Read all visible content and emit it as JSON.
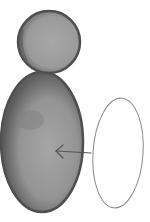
{
  "illustration": {
    "description": "Watercolor drawing of a snowman-like figure made of a gray filled circle (head) atop a tall gray filled ellipse (body), with an empty outlined ellipse to the right and an arrow pointing from the outline into the body",
    "colors": {
      "fill_light": "#a9a9a9",
      "fill_mid": "#8f8f8f",
      "fill_dark": "#5a5a5a",
      "outline": "#8a8a8a",
      "arrow": "#555555",
      "background": "#ffffff"
    },
    "shapes": {
      "head": {
        "type": "filled-circle",
        "cx": 49,
        "cy": 42,
        "rx": 31,
        "ry": 31
      },
      "body": {
        "type": "filled-ellipse",
        "cx": 42,
        "cy": 142,
        "rx": 41,
        "ry": 70
      },
      "outline_ellipse": {
        "type": "outlined-ellipse",
        "cx": 118,
        "cy": 153,
        "rx": 25,
        "ry": 55
      },
      "arrow": {
        "from": [
          91,
          153
        ],
        "to": [
          56,
          151
        ],
        "direction": "left"
      }
    }
  }
}
